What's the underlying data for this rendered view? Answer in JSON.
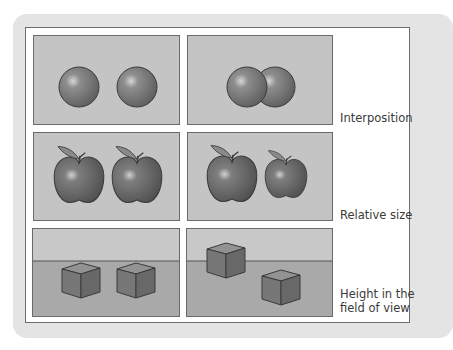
{
  "figure": {
    "rows": [
      {
        "label": "Interposition",
        "left_description": "Two separate spheres side by side",
        "right_description": "Two spheres, one partially occluding the other"
      },
      {
        "label": "Relative size",
        "left_description": "Two equal-size apples",
        "right_description": "A larger apple next to a smaller apple"
      },
      {
        "label": "Height in the\nfield of view",
        "left_description": "Two cubes on the same level below horizon",
        "right_description": "One cube higher near the horizon, one lower in the foreground"
      }
    ],
    "colors": {
      "card_background": "#e4e4e4",
      "panel_background": "#ffffff",
      "tile_background": "#c4c4c4",
      "ground": "#a9a9a9",
      "object": "#7d7d7d",
      "outline": "#3c3c3c"
    }
  }
}
